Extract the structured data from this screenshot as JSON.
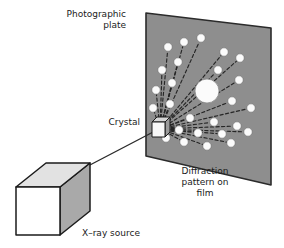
{
  "figure": {
    "background_color": "#ffffff",
    "width": 284,
    "height": 248
  },
  "labels": {
    "photographic_plate": "Photographic\nplate",
    "crystal": "Crystal",
    "diffraction_pattern": "Diffraction\npattern on\nfilm",
    "xray_source": "X–ray source"
  },
  "colors": {
    "plate_fill": "#8e8e8e",
    "plate_edge": "#2b2b2b",
    "spot_fill": "#fbfbfb",
    "spot_edge": "#6f6f6f",
    "ray_color": "#262626",
    "cube_front": "#ffffff",
    "cube_top": "#e2e2e2",
    "cube_side": "#a9a9a9",
    "cube_edge": "#1b1b1b",
    "crystal_front": "#f7f7f7",
    "crystal_top": "#d5d5d5",
    "crystal_side": "#9a9a9a",
    "beam_color": "#2b2b2b",
    "text_color": "#1b1b1b"
  },
  "plate": {
    "name": "photographic-plate",
    "corners": [
      [
        146,
        13
      ],
      [
        271,
        28
      ],
      [
        271,
        185
      ],
      [
        146,
        156
      ]
    ]
  },
  "crystal": {
    "name": "crystal-cube",
    "origin": [
      160,
      129
    ],
    "front": [
      [
        152,
        122
      ],
      [
        165,
        122
      ],
      [
        165,
        137
      ],
      [
        152,
        137
      ]
    ],
    "top": [
      [
        152,
        122
      ],
      [
        157,
        117
      ],
      [
        170,
        117
      ],
      [
        165,
        122
      ]
    ],
    "side": [
      [
        165,
        122
      ],
      [
        170,
        117
      ],
      [
        170,
        132
      ],
      [
        165,
        137
      ]
    ]
  },
  "xray_source": {
    "name": "xray-source-cube",
    "front": [
      [
        16,
        187
      ],
      [
        60,
        187
      ],
      [
        60,
        235
      ],
      [
        16,
        235
      ]
    ],
    "top": [
      [
        16,
        187
      ],
      [
        46,
        163
      ],
      [
        90,
        163
      ],
      [
        60,
        187
      ]
    ],
    "side": [
      [
        60,
        187
      ],
      [
        90,
        163
      ],
      [
        90,
        211
      ],
      [
        60,
        235
      ]
    ]
  },
  "beam": {
    "name": "incident-xray-beam",
    "from": [
      88,
      166
    ],
    "to": [
      157,
      130
    ]
  },
  "chart_data": {
    "type": "scatter",
    "xlabel": "",
    "ylabel": "",
    "origin": [
      160,
      129
    ],
    "central_spot": {
      "cx": 207,
      "cy": 91,
      "r": 12,
      "label": "direct beam spot"
    },
    "spots": [
      {
        "cx": 168,
        "cy": 47,
        "r": 4.2
      },
      {
        "cx": 184,
        "cy": 42,
        "r": 4.2
      },
      {
        "cx": 201,
        "cy": 38,
        "r": 4.2
      },
      {
        "cx": 224,
        "cy": 52,
        "r": 4.2
      },
      {
        "cx": 240,
        "cy": 58,
        "r": 4.2
      },
      {
        "cx": 162,
        "cy": 70,
        "r": 4.2
      },
      {
        "cx": 178,
        "cy": 62,
        "r": 4.2
      },
      {
        "cx": 218,
        "cy": 70,
        "r": 4.2
      },
      {
        "cx": 239,
        "cy": 80,
        "r": 4.2
      },
      {
        "cx": 156,
        "cy": 90,
        "r": 4.2
      },
      {
        "cx": 172,
        "cy": 83,
        "r": 4.2
      },
      {
        "cx": 232,
        "cy": 101,
        "r": 4.2
      },
      {
        "cx": 251,
        "cy": 108,
        "r": 4.2
      },
      {
        "cx": 153,
        "cy": 108,
        "r": 4.2
      },
      {
        "cx": 170,
        "cy": 104,
        "r": 4.2
      },
      {
        "cx": 190,
        "cy": 118,
        "r": 4.2
      },
      {
        "cx": 214,
        "cy": 122,
        "r": 4.2
      },
      {
        "cx": 237,
        "cy": 126,
        "r": 4.2
      },
      {
        "cx": 179,
        "cy": 130,
        "r": 4.2
      },
      {
        "cx": 198,
        "cy": 133,
        "r": 4.2
      },
      {
        "cx": 222,
        "cy": 134,
        "r": 4.2
      },
      {
        "cx": 248,
        "cy": 132,
        "r": 4.2
      },
      {
        "cx": 184,
        "cy": 142,
        "r": 4.2
      },
      {
        "cx": 207,
        "cy": 146,
        "r": 4.2
      },
      {
        "cx": 231,
        "cy": 143,
        "r": 4.2
      },
      {
        "cx": 166,
        "cy": 138,
        "r": 4.2
      }
    ]
  }
}
